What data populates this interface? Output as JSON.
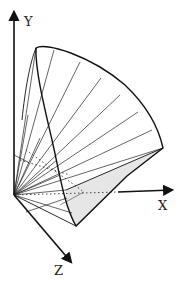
{
  "figure": {
    "axes": {
      "x_label": "X",
      "y_label": "Y",
      "z_label": "Z"
    },
    "colors": {
      "line": "#1a1a1a",
      "shaded_face": "#e8e8e8",
      "background": "#ffffff"
    }
  }
}
